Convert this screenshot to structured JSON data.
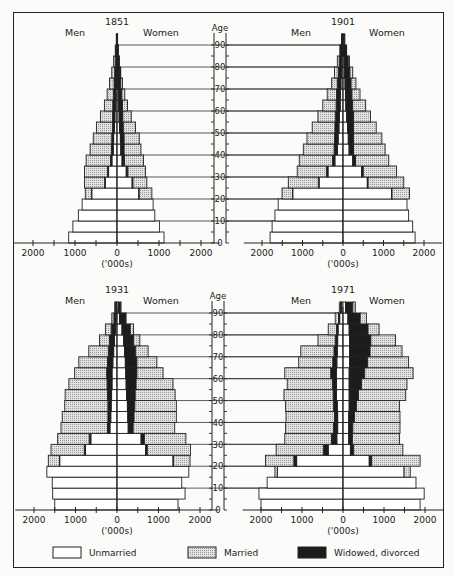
{
  "figure": {
    "units_label": "('000s)",
    "age_label": "Age",
    "men_label": "Men",
    "women_label": "Women",
    "age_ticks": [
      "0",
      "10",
      "20",
      "30",
      "40",
      "50",
      "60",
      "70",
      "80",
      "90"
    ],
    "x_ticks": [
      "2000",
      "1000",
      "0",
      "1000",
      "2000"
    ]
  },
  "legend": [
    {
      "key": "unmarried",
      "label": "Unmarried",
      "color": "#ffffff"
    },
    {
      "key": "married",
      "label": "Married",
      "color": "#d4d4d4"
    },
    {
      "key": "widowed",
      "label": "Widowed, divorced",
      "color": "#1c1c1c"
    }
  ],
  "chart_data": [
    {
      "type": "population-pyramid",
      "title": "1851",
      "xlabel": "('000s)",
      "ylabel": "Age",
      "age_groups": [
        "0-4",
        "5-9",
        "10-14",
        "15-19",
        "20-24",
        "25-29",
        "30-34",
        "35-39",
        "40-44",
        "45-49",
        "50-54",
        "55-59",
        "60-64",
        "65-69",
        "70-74",
        "75-79",
        "80-84",
        "85-89",
        "90+"
      ],
      "men": {
        "unmarried": [
          1150,
          1050,
          920,
          830,
          600,
          280,
          200,
          120,
          90,
          80,
          60,
          50,
          40,
          30,
          20,
          15,
          10,
          6,
          3
        ],
        "married": [
          0,
          0,
          0,
          0,
          150,
          480,
          550,
          580,
          510,
          440,
          380,
          290,
          200,
          150,
          110,
          70,
          40,
          20,
          8
        ],
        "widowed": [
          0,
          0,
          0,
          0,
          5,
          15,
          25,
          35,
          40,
          45,
          50,
          55,
          60,
          55,
          50,
          40,
          30,
          15,
          6
        ]
      },
      "women": {
        "unmarried": [
          1120,
          1010,
          900,
          860,
          520,
          360,
          220,
          120,
          90,
          80,
          60,
          50,
          40,
          30,
          20,
          15,
          10,
          5,
          3
        ],
        "married": [
          0,
          0,
          0,
          0,
          300,
          330,
          420,
          450,
          400,
          360,
          290,
          200,
          120,
          70,
          40,
          20,
          10,
          5,
          2
        ],
        "widowed": [
          0,
          0,
          0,
          0,
          10,
          20,
          40,
          60,
          80,
          90,
          90,
          90,
          90,
          85,
          70,
          55,
          40,
          25,
          10
        ]
      },
      "xlim": [
        -2500,
        2500
      ],
      "ylim": [
        0,
        95
      ]
    },
    {
      "type": "population-pyramid",
      "title": "1901",
      "xlabel": "('000s)",
      "ylabel": "Age",
      "age_groups": [
        "0-4",
        "5-9",
        "10-14",
        "15-19",
        "20-24",
        "25-29",
        "30-34",
        "35-39",
        "40-44",
        "45-49",
        "50-54",
        "55-59",
        "60-64",
        "65-69",
        "70-74",
        "75-79",
        "80-84",
        "85-89",
        "90+"
      ],
      "men": {
        "unmarried": [
          1800,
          1750,
          1680,
          1600,
          1240,
          590,
          370,
          200,
          140,
          120,
          100,
          90,
          70,
          60,
          50,
          40,
          30,
          20,
          8
        ],
        "married": [
          0,
          0,
          0,
          0,
          260,
          740,
          720,
          820,
          760,
          680,
          560,
          430,
          330,
          230,
          140,
          90,
          50,
          20,
          8
        ],
        "widowed": [
          0,
          0,
          0,
          0,
          5,
          20,
          40,
          60,
          80,
          90,
          100,
          100,
          100,
          100,
          90,
          80,
          60,
          40,
          20
        ]
      },
      "women": {
        "unmarried": [
          1780,
          1720,
          1620,
          1580,
          1200,
          600,
          460,
          240,
          150,
          130,
          110,
          90,
          70,
          60,
          50,
          40,
          30,
          20,
          10
        ],
        "married": [
          0,
          0,
          0,
          0,
          430,
          880,
          820,
          820,
          780,
          700,
          560,
          420,
          320,
          200,
          120,
          70,
          30,
          10,
          5
        ],
        "widowed": [
          0,
          0,
          0,
          0,
          10,
          20,
          40,
          70,
          110,
          130,
          150,
          170,
          170,
          160,
          150,
          130,
          100,
          60,
          30
        ]
      },
      "xlim": [
        -2500,
        2500
      ],
      "ylim": [
        0,
        95
      ]
    },
    {
      "type": "population-pyramid",
      "title": "1931",
      "xlabel": "('000s)",
      "ylabel": "Age",
      "age_groups": [
        "0-4",
        "5-9",
        "10-14",
        "15-19",
        "20-24",
        "25-29",
        "30-34",
        "35-39",
        "40-44",
        "45-49",
        "50-54",
        "55-59",
        "60-64",
        "65-69",
        "70-74",
        "75-79",
        "80-84",
        "85-89",
        "90+"
      ],
      "men": {
        "unmarried": [
          1500,
          1550,
          1560,
          1690,
          1380,
          760,
          630,
          170,
          150,
          140,
          130,
          120,
          120,
          100,
          80,
          60,
          40,
          25,
          10
        ],
        "married": [
          0,
          0,
          0,
          0,
          270,
          800,
          760,
          1120,
          1100,
          1040,
          1020,
          920,
          770,
          690,
          470,
          240,
          140,
          50,
          20
        ],
        "widowed": [
          0,
          0,
          0,
          0,
          5,
          30,
          40,
          60,
          70,
          80,
          100,
          120,
          130,
          130,
          130,
          120,
          100,
          50,
          25
        ]
      },
      "women": {
        "unmarried": [
          1470,
          1640,
          1560,
          1730,
          1350,
          690,
          580,
          270,
          260,
          250,
          230,
          220,
          210,
          200,
          180,
          160,
          120,
          60,
          30
        ],
        "market_note": "",
        "married": [
          0,
          0,
          0,
          0,
          400,
          1040,
          1000,
          1000,
          1020,
          1000,
          960,
          890,
          630,
          480,
          300,
          150,
          80,
          20,
          5
        ],
        "widowed": [
          0,
          0,
          0,
          0,
          10,
          40,
          80,
          120,
          150,
          180,
          210,
          240,
          270,
          280,
          270,
          240,
          200,
          140,
          60
        ]
      },
      "xlim": [
        -2500,
        2500
      ],
      "ylim": [
        0,
        95
      ]
    },
    {
      "type": "population-pyramid",
      "title": "1971",
      "xlabel": "('000s)",
      "ylabel": "Age",
      "age_groups": [
        "0-4",
        "5-9",
        "10-14",
        "15-19",
        "20-24",
        "25-29",
        "30-34",
        "35-39",
        "40-44",
        "45-49",
        "50-54",
        "55-59",
        "60-64",
        "65-69",
        "70-74",
        "75-79",
        "80-84",
        "85-89",
        "90+"
      ],
      "men": {
        "unmarried": [
          2000,
          2050,
          1850,
          1600,
          1130,
          360,
          150,
          130,
          130,
          140,
          160,
          160,
          160,
          150,
          140,
          130,
          120,
          80,
          40
        ],
        "married": [
          0,
          0,
          0,
          60,
          690,
          1150,
          1140,
          1170,
          1180,
          1170,
          1200,
          1100,
          1120,
          830,
          810,
          420,
          200,
          80,
          30
        ],
        "widowed": [
          0,
          0,
          0,
          0,
          70,
          120,
          130,
          100,
          80,
          90,
          80,
          100,
          140,
          100,
          80,
          60,
          40,
          30,
          20
        ]
      },
      "women": {
        "unmarried": [
          1880,
          1980,
          1780,
          1490,
          640,
          180,
          140,
          140,
          140,
          150,
          150,
          150,
          150,
          160,
          160,
          160,
          150,
          120,
          60
        ],
        "married": [
          0,
          0,
          0,
          150,
          1180,
          1200,
          1150,
          1150,
          1110,
          1050,
          1150,
          1110,
          1180,
          1000,
          780,
          600,
          270,
          150,
          60
        ],
        "widowed": [
          0,
          0,
          0,
          0,
          60,
          80,
          90,
          100,
          140,
          180,
          230,
          300,
          380,
          440,
          500,
          520,
          460,
          300,
          180
        ]
      },
      "xlim": [
        -2500,
        2500
      ],
      "ylim": [
        0,
        95
      ]
    }
  ]
}
